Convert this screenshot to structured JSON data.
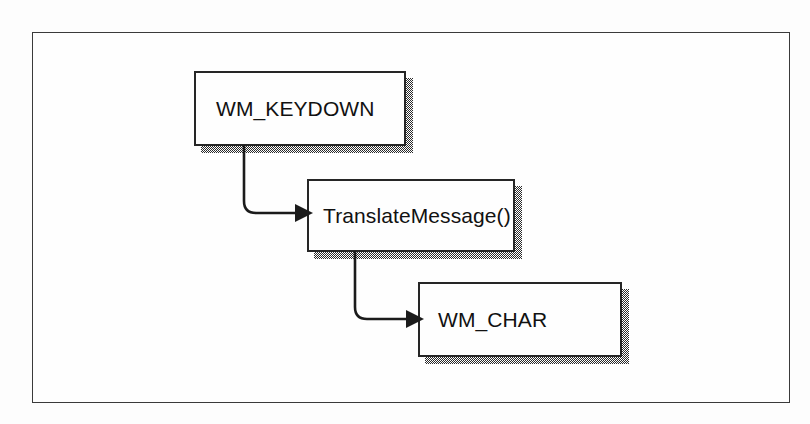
{
  "figure": {
    "kind": "flow-diagram",
    "frame": {
      "border_color": "#3a3a3a",
      "background": "#fefefe"
    },
    "shadow_color": "#2b2b2b",
    "node_border_color": "#262626",
    "connector_color": "#1b1b1b"
  },
  "nodes": [
    {
      "id": "wm-keydown",
      "label": "WM_KEYDOWN",
      "x": 193,
      "y": 70,
      "w": 212,
      "h": 75,
      "label_x": 20,
      "label_y": 25
    },
    {
      "id": "translatemessage",
      "label": "TranslateMessage()",
      "x": 306,
      "y": 178,
      "w": 208,
      "h": 73,
      "label_x": 14,
      "label_y": 24
    },
    {
      "id": "wm-char",
      "label": "WM_CHAR",
      "x": 417,
      "y": 281,
      "w": 204,
      "h": 75,
      "label_x": 18,
      "label_y": 25
    }
  ],
  "edges": [
    {
      "id": "keydown-to-translate",
      "from": "wm-keydown",
      "to": "translatemessage",
      "arrow": "arrowhead-right"
    },
    {
      "id": "translate-to-char",
      "from": "translatemessage",
      "to": "wm-char",
      "arrow": "arrowhead-right"
    }
  ]
}
